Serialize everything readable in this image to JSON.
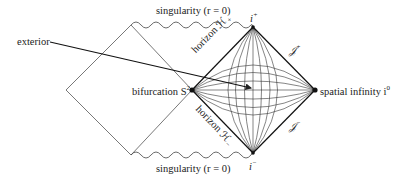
{
  "colors": {
    "ink": "#222222",
    "background": "#ffffff"
  },
  "labels": {
    "singularity_top": "singularity (r = 0)",
    "singularity_bottom": "singularity (r = 0)",
    "exterior": "exterior",
    "bifurcation": "bifurcation S",
    "bifurcation_sup": "2",
    "spatial_infinity": "spatial infinity i",
    "spatial_infinity_sup": "0",
    "future_timelike_infinity": "i",
    "future_timelike_infinity_sup": "+",
    "past_timelike_infinity": "i",
    "past_timelike_infinity_sup": "−",
    "future_null_infinity": "𝒥",
    "future_null_infinity_sup": "+",
    "past_null_infinity": "𝒥",
    "past_null_infinity_sup": "−",
    "horizon_future": "horizon ℋ",
    "horizon_future_sub": "+",
    "horizon_past": "horizon ℋ",
    "horizon_past_sub": "−"
  },
  "geometry": {
    "left_diamond": {
      "top": [
        131,
        25
      ],
      "left": [
        66,
        90
      ],
      "bottom": [
        131,
        155
      ],
      "right": [
        192,
        90
      ]
    },
    "right_diamond": {
      "top": [
        253,
        27
      ],
      "left": [
        192,
        90
      ],
      "bottom": [
        253,
        153
      ],
      "right": [
        315,
        90
      ]
    },
    "exterior_arrow": {
      "from": [
        50,
        42
      ],
      "to": [
        252,
        88
      ]
    }
  }
}
